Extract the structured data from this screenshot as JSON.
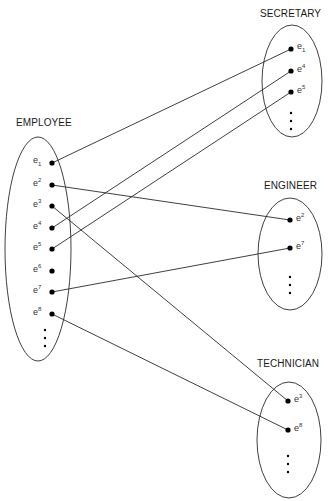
{
  "diagram": {
    "type": "set-mapping",
    "sets": [
      {
        "id": "employee",
        "label": "EMPLOYEE",
        "ellipse": {
          "cx": 38,
          "cy": 249,
          "rx": 33,
          "ry": 112
        },
        "label_pos": {
          "x": 16,
          "y": 117
        },
        "elements": [
          {
            "id": "e1",
            "base": "e",
            "sub": "1",
            "sup": "",
            "x": 52,
            "y": 163
          },
          {
            "id": "e2",
            "base": "e",
            "sub": "",
            "sup": "2",
            "x": 52,
            "y": 185
          },
          {
            "id": "e3",
            "base": "e",
            "sub": "",
            "sup": "3",
            "x": 52,
            "y": 206
          },
          {
            "id": "e4",
            "base": "e",
            "sub": "",
            "sup": "4",
            "x": 52,
            "y": 228
          },
          {
            "id": "e5",
            "base": "e",
            "sub": "",
            "sup": "5",
            "x": 52,
            "y": 249
          },
          {
            "id": "e6",
            "base": "e",
            "sub": "",
            "sup": "6",
            "x": 52,
            "y": 271
          },
          {
            "id": "e7",
            "base": "e",
            "sub": "",
            "sup": "7",
            "x": 52,
            "y": 292
          },
          {
            "id": "e8",
            "base": "e",
            "sub": "",
            "sup": "8",
            "x": 52,
            "y": 314
          }
        ],
        "ellipsis_dots": [
          {
            "x": 45,
            "y": 330
          },
          {
            "x": 45,
            "y": 338
          },
          {
            "x": 45,
            "y": 346
          }
        ]
      },
      {
        "id": "secretary",
        "label": "SECRETARY",
        "ellipse": {
          "cx": 292,
          "cy": 81,
          "rx": 30,
          "ry": 56
        },
        "label_pos": {
          "x": 260,
          "y": 8
        },
        "elements": [
          {
            "id": "e1",
            "base": "e",
            "sub": "1",
            "sup": "",
            "x": 291,
            "y": 49
          },
          {
            "id": "e4",
            "base": "e",
            "sub": "",
            "sup": "4",
            "x": 291,
            "y": 71
          },
          {
            "id": "e5",
            "base": "e",
            "sub": "",
            "sup": "5",
            "x": 291,
            "y": 92
          }
        ],
        "ellipsis_dots": [
          {
            "x": 291,
            "y": 113
          },
          {
            "x": 291,
            "y": 121
          },
          {
            "x": 291,
            "y": 129
          }
        ]
      },
      {
        "id": "engineer",
        "label": "ENGINEER",
        "ellipse": {
          "cx": 290,
          "cy": 254,
          "rx": 32,
          "ry": 56
        },
        "label_pos": {
          "x": 264,
          "y": 180
        },
        "elements": [
          {
            "id": "e2",
            "base": "e",
            "sub": "",
            "sup": "2",
            "x": 290,
            "y": 220
          },
          {
            "id": "e7",
            "base": "e",
            "sub": "",
            "sup": "7",
            "x": 290,
            "y": 248
          }
        ],
        "ellipsis_dots": [
          {
            "x": 290,
            "y": 277
          },
          {
            "x": 290,
            "y": 285
          },
          {
            "x": 290,
            "y": 293
          }
        ]
      },
      {
        "id": "technician",
        "label": "TECHNICIAN",
        "ellipse": {
          "cx": 289,
          "cy": 440,
          "rx": 32,
          "ry": 58
        },
        "label_pos": {
          "x": 257,
          "y": 358
        },
        "elements": [
          {
            "id": "e3",
            "base": "e",
            "sub": "",
            "sup": "3",
            "x": 288,
            "y": 401
          },
          {
            "id": "e8",
            "base": "e",
            "sub": "",
            "sup": "8",
            "x": 288,
            "y": 430
          }
        ],
        "ellipsis_dots": [
          {
            "x": 288,
            "y": 456
          },
          {
            "x": 288,
            "y": 464
          },
          {
            "x": 288,
            "y": 472
          }
        ]
      }
    ],
    "links": [
      {
        "from": "employee.e1",
        "to": "secretary.e1"
      },
      {
        "from": "employee.e4",
        "to": "secretary.e4"
      },
      {
        "from": "employee.e5",
        "to": "secretary.e5"
      },
      {
        "from": "employee.e2",
        "to": "engineer.e2"
      },
      {
        "from": "employee.e7",
        "to": "engineer.e7"
      },
      {
        "from": "employee.e3",
        "to": "technician.e3"
      },
      {
        "from": "employee.e8",
        "to": "technician.e8"
      }
    ],
    "colors": {
      "stroke": "#2a2a2a",
      "dot": "#000000",
      "text": "#1a1a1a"
    }
  }
}
